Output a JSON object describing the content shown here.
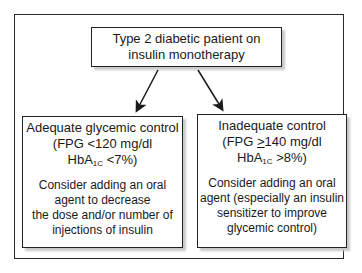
{
  "diagram": {
    "top_box": {
      "line1": "Type 2 diabetic patient on",
      "line2": "insulin monotherapy"
    },
    "left_box": {
      "title": "Adequate glycemic control",
      "criteria_line1": "(FPG <120 mg/dl",
      "criteria_hba_prefix": "HbA",
      "criteria_hba_sub": "1C",
      "criteria_hba_suffix": " <7%)",
      "advice_lines": [
        "Consider adding an oral",
        "agent to decrease",
        "the dose and/or number of",
        "injections of insulin"
      ]
    },
    "right_box": {
      "title": "Inadequate control",
      "criteria_prefix": "(FPG ",
      "criteria_ge": ">",
      "criteria_rest": "140 mg/dl",
      "criteria_hba_prefix": "HbA",
      "criteria_hba_sub": "1C",
      "criteria_hba_suffix": " >8%)",
      "advice_lines": [
        "Consider adding an oral",
        "agent (especially an insulin",
        "sensitizer to improve",
        "glycemic control)"
      ]
    },
    "colors": {
      "border": "#222222",
      "shadow": "#c9c9c9",
      "background": "#ffffff"
    }
  }
}
